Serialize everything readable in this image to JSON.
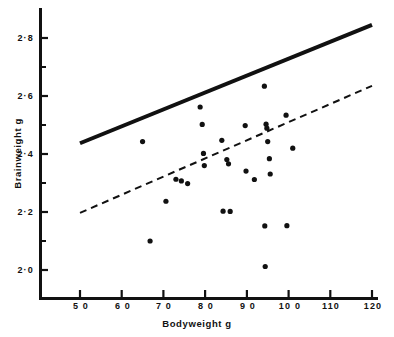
{
  "chart_data": {
    "type": "scatter",
    "title": "",
    "xlabel": "Bodyweight  g",
    "ylabel": "Brainweight  g",
    "xlim": [
      43,
      123
    ],
    "ylim": [
      1.93,
      2.86
    ],
    "grid": false,
    "legend": "none",
    "xticks": [
      50,
      60,
      70,
      80,
      90,
      100,
      110,
      120
    ],
    "xticklabels": [
      "5 0",
      "6 0",
      "7 0",
      "8 0",
      "9 0",
      "10 0",
      "110",
      "120"
    ],
    "yticks": [
      2.0,
      2.2,
      2.4,
      2.6,
      2.8
    ],
    "yticklabels": [
      "2·0",
      "2·2",
      "2·4",
      "2·6",
      "2·8"
    ],
    "yminorticks": [
      2.1,
      2.3,
      2.5,
      2.7
    ],
    "points": [
      {
        "x": 65.0,
        "y": 2.443
      },
      {
        "x": 66.8,
        "y": 2.1
      },
      {
        "x": 70.6,
        "y": 2.237
      },
      {
        "x": 73.0,
        "y": 2.313
      },
      {
        "x": 74.3,
        "y": 2.307
      },
      {
        "x": 75.8,
        "y": 2.298
      },
      {
        "x": 78.8,
        "y": 2.562
      },
      {
        "x": 79.3,
        "y": 2.502
      },
      {
        "x": 79.6,
        "y": 2.402
      },
      {
        "x": 79.8,
        "y": 2.36
      },
      {
        "x": 84.0,
        "y": 2.447
      },
      {
        "x": 84.3,
        "y": 2.203
      },
      {
        "x": 85.2,
        "y": 2.381
      },
      {
        "x": 85.6,
        "y": 2.366
      },
      {
        "x": 86.0,
        "y": 2.202
      },
      {
        "x": 89.6,
        "y": 2.498
      },
      {
        "x": 89.8,
        "y": 2.341
      },
      {
        "x": 91.8,
        "y": 2.312
      },
      {
        "x": 94.2,
        "y": 2.634
      },
      {
        "x": 94.3,
        "y": 2.152
      },
      {
        "x": 94.4,
        "y": 2.012
      },
      {
        "x": 94.6,
        "y": 2.503
      },
      {
        "x": 94.8,
        "y": 2.489
      },
      {
        "x": 95.0,
        "y": 2.443
      },
      {
        "x": 95.4,
        "y": 2.384
      },
      {
        "x": 95.6,
        "y": 2.331
      },
      {
        "x": 99.4,
        "y": 2.534
      },
      {
        "x": 99.6,
        "y": 2.153
      },
      {
        "x": 101.0,
        "y": 2.42
      }
    ],
    "lines": [
      {
        "name": "solid-reference-line",
        "style": "solid",
        "x": [
          50,
          120
        ],
        "y": [
          2.437,
          2.845
        ],
        "width": 4
      },
      {
        "name": "dashed-regression-line",
        "style": "dashed",
        "x": [
          50,
          120
        ],
        "y": [
          2.197,
          2.635
        ],
        "width": 2
      }
    ]
  },
  "caption": {
    "text": ""
  }
}
